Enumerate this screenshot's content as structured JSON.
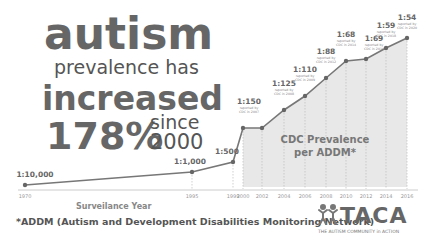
{
  "headline": {
    "line1": "autism",
    "line2": "prevalence has",
    "line3": "increased",
    "line4_pct": "178%",
    "line4_since": "since",
    "line4_year": "2000"
  },
  "footnote": "*ADDM (Autism and Development Disabilities Monitoring Network)",
  "logo": {
    "name": "TACA",
    "tagline": "THE AUTISM COMMUNITY in ACTION",
    "icon": "people-figures-icon"
  },
  "colors": {
    "text": "#666666",
    "line": "#777777",
    "fill": "#e8e8e8",
    "grid": "#bbbbbb"
  },
  "chart_data": {
    "type": "line",
    "xlabel": "Surveilance Year",
    "ylabel": "",
    "shaded_region_label": "CDC Prevalence per ADDM*",
    "shaded_region_x": [
      2000,
      2016
    ],
    "x": [
      1970,
      1995,
      1999,
      2000,
      2002,
      2004,
      2006,
      2008,
      2010,
      2012,
      2014,
      2016
    ],
    "tick_labels": [
      "1970",
      "1995",
      "1999",
      "2000",
      "2002",
      "2004",
      "2006",
      "2008",
      "2010",
      "2012",
      "2014",
      "2016"
    ],
    "series": [
      {
        "name": "Autism prevalence (1 in N)",
        "labels": [
          "1:10,000",
          "1:1,000",
          "1:500",
          "1:150",
          "1:150",
          "1:125",
          "1:110",
          "1:88",
          "1:68",
          "1:69",
          "1:59",
          "1:54"
        ],
        "values": [
          10000,
          1000,
          500,
          150,
          150,
          125,
          110,
          88,
          68,
          69,
          59,
          54
        ]
      }
    ],
    "point_labels": [
      {
        "x": 1970,
        "label": "1:10,000"
      },
      {
        "x": 1995,
        "label": "1:1,000"
      },
      {
        "x": 1999,
        "label": "1:500"
      },
      {
        "x": 2000,
        "label": "1:150",
        "note": "reported by CDC in 2007"
      },
      {
        "x": 2004,
        "label": "1:125",
        "note": "reported by CDC in 2008"
      },
      {
        "x": 2006,
        "label": "1:110",
        "note": "reported by CDC in 2009"
      },
      {
        "x": 2008,
        "label": "1:88",
        "note": "reported by CDC in 2012"
      },
      {
        "x": 2010,
        "label": "1:68",
        "note": "reported by CDC in 2014"
      },
      {
        "x": 2012,
        "label": "1:69",
        "note": "reported by CDC in 2016"
      },
      {
        "x": 2014,
        "label": "1:59",
        "note": "reported by CDC in 2018"
      },
      {
        "x": 2016,
        "label": "1:54",
        "note": "reported by CDC in 2020"
      }
    ],
    "grid": false,
    "legend": "none"
  }
}
